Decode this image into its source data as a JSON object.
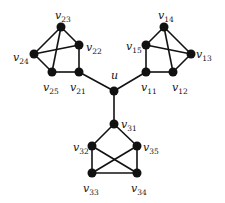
{
  "graph": {
    "nodes": [
      {
        "id": "u",
        "label": "u",
        "sub": "",
        "x": 114,
        "y": 91,
        "lx": 111,
        "ly": 79
      },
      {
        "id": "v11",
        "label": "v",
        "sub": "11",
        "x": 146,
        "y": 72,
        "lx": 141,
        "ly": 91
      },
      {
        "id": "v12",
        "label": "v",
        "sub": "12",
        "x": 173,
        "y": 72,
        "lx": 172,
        "ly": 91
      },
      {
        "id": "v13",
        "label": "v",
        "sub": "13",
        "x": 191,
        "y": 54,
        "lx": 196,
        "ly": 58
      },
      {
        "id": "v14",
        "label": "v",
        "sub": "14",
        "x": 164,
        "y": 27,
        "lx": 158,
        "ly": 19
      },
      {
        "id": "v15",
        "label": "v",
        "sub": "15",
        "x": 146,
        "y": 45,
        "lx": 126,
        "ly": 50
      },
      {
        "id": "v21",
        "label": "v",
        "sub": "21",
        "x": 79,
        "y": 72,
        "lx": 70,
        "ly": 91
      },
      {
        "id": "v22",
        "label": "v",
        "sub": "22",
        "x": 79,
        "y": 45,
        "lx": 86,
        "ly": 51
      },
      {
        "id": "v23",
        "label": "v",
        "sub": "23",
        "x": 61,
        "y": 27,
        "lx": 55,
        "ly": 19
      },
      {
        "id": "v24",
        "label": "v",
        "sub": "24",
        "x": 34,
        "y": 54,
        "lx": 13,
        "ly": 61
      },
      {
        "id": "v25",
        "label": "v",
        "sub": "25",
        "x": 52,
        "y": 72,
        "lx": 43,
        "ly": 91
      },
      {
        "id": "v31",
        "label": "v",
        "sub": "31",
        "x": 114,
        "y": 124,
        "lx": 121,
        "ly": 128
      },
      {
        "id": "v32",
        "label": "v",
        "sub": "32",
        "x": 92,
        "y": 146,
        "lx": 73,
        "ly": 151
      },
      {
        "id": "v33",
        "label": "v",
        "sub": "33",
        "x": 92,
        "y": 173,
        "lx": 83,
        "ly": 192
      },
      {
        "id": "v34",
        "label": "v",
        "sub": "34",
        "x": 137,
        "y": 173,
        "lx": 131,
        "ly": 192
      },
      {
        "id": "v35",
        "label": "v",
        "sub": "35",
        "x": 137,
        "y": 146,
        "lx": 143,
        "ly": 151
      }
    ],
    "edges": [
      [
        "u",
        "v11"
      ],
      [
        "u",
        "v21"
      ],
      [
        "u",
        "v31"
      ],
      [
        "v14",
        "v15"
      ],
      [
        "v14",
        "v13"
      ],
      [
        "v14",
        "v12"
      ],
      [
        "v15",
        "v13"
      ],
      [
        "v15",
        "v11"
      ],
      [
        "v11",
        "v12"
      ],
      [
        "v12",
        "v13"
      ],
      [
        "v23",
        "v22"
      ],
      [
        "v23",
        "v24"
      ],
      [
        "v23",
        "v25"
      ],
      [
        "v24",
        "v22"
      ],
      [
        "v24",
        "v25"
      ],
      [
        "v25",
        "v21"
      ],
      [
        "v21",
        "v22"
      ],
      [
        "v31",
        "v32"
      ],
      [
        "v31",
        "v35"
      ],
      [
        "v32",
        "v33"
      ],
      [
        "v32",
        "v34"
      ],
      [
        "v35",
        "v33"
      ],
      [
        "v35",
        "v34"
      ],
      [
        "v33",
        "v34"
      ]
    ],
    "colors": {
      "node": "#111111",
      "edge": "#111111",
      "background": "#ffffff"
    }
  }
}
